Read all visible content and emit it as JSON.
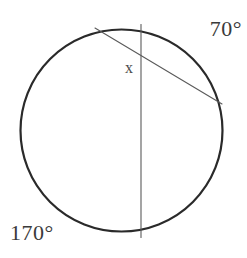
{
  "figure": {
    "type": "circle-geometry-diagram",
    "background_color": "#ffffff",
    "stroke_color_circle": "#2a2a2a",
    "stroke_color_chord": "#5a5a5a",
    "text_color": "#3a3a3a"
  },
  "labels": {
    "arc_top_right": "70°",
    "arc_bottom_left": "170°",
    "unknown_angle": "x"
  },
  "chart_data": {
    "type": "diagram",
    "title": "",
    "shapes": [
      {
        "name": "circle",
        "kind": "circle",
        "cx": 121.5,
        "cy": 130.5,
        "r": 101,
        "stroke": "#2a2a2a",
        "stroke_width": 2.2,
        "fill": "none"
      },
      {
        "name": "vertical-chord",
        "kind": "line",
        "x1": 141,
        "y1": 24.5,
        "x2": 141,
        "y2": 237.5,
        "stroke": "#5a5a5a",
        "stroke_width": 1.1
      },
      {
        "name": "diagonal-chord",
        "kind": "line",
        "x1": 95,
        "y1": 28,
        "x2": 222,
        "y2": 104,
        "stroke": "#5a5a5a",
        "stroke_width": 1.1
      }
    ],
    "intersection_point": {
      "x": 141,
      "y": 60
    },
    "annotations": [
      {
        "text": "70°",
        "x": 220,
        "y": 30,
        "meaning": "intercepted arc measure, upper right"
      },
      {
        "text": "170°",
        "x": 38,
        "y": 234,
        "meaning": "intercepted arc measure, lower left"
      },
      {
        "text": "x",
        "x": 131,
        "y": 68,
        "meaning": "unknown angle at chord intersection"
      }
    ]
  }
}
